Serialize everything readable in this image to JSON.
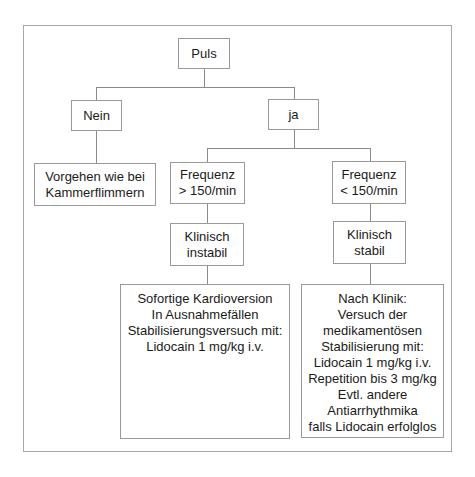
{
  "diagram": {
    "type": "flowchart",
    "root": {
      "label": "Puls"
    },
    "branches": {
      "nein": {
        "label": "Nein",
        "action": [
          "Vorgehen wie bei",
          "Kammerflimmern"
        ]
      },
      "ja": {
        "label": "ja",
        "fast": {
          "condition": [
            "Frequenz",
            "> 150/min"
          ],
          "state": [
            "Klinisch",
            "instabil"
          ],
          "action": [
            "Sofortige Kardioversion",
            "In Ausnahmefällen",
            "Stabilisierungsversuch mit:",
            "Lidocain 1 mg/kg i.v."
          ]
        },
        "slow": {
          "condition": [
            "Frequenz",
            "< 150/min"
          ],
          "state": [
            "Klinisch",
            "stabil"
          ],
          "action": [
            "Nach Klinik:",
            "Versuch der",
            "medikamentösen",
            "Stabilisierung mit:",
            "Lidocain 1 mg/kg i.v.",
            "Repetition bis 3 mg/kg",
            "Evtl. andere",
            "Antiarrhythmika",
            "falls Lidocain erfolglos"
          ]
        }
      }
    },
    "colors": {
      "border": "#9a9a9a",
      "line": "#8a8a8a",
      "text": "#1a1a1a",
      "background": "#ffffff"
    }
  }
}
